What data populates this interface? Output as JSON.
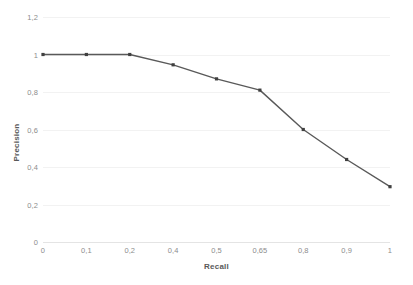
{
  "chart_data": {
    "type": "line",
    "title": "",
    "xlabel": "Recall",
    "ylabel": "Precision",
    "categories": [
      "0",
      "0,1",
      "0,2",
      "0,4",
      "0,5",
      "0,65",
      "0,8",
      "0,9",
      "1"
    ],
    "x_values": [
      0,
      0.1,
      0.2,
      0.4,
      0.5,
      0.65,
      0.8,
      0.9,
      1
    ],
    "series": [
      {
        "name": "Precision",
        "values": [
          1,
          1,
          1,
          0.945,
          0.87,
          0.81,
          0.6,
          0.44,
          0.295
        ]
      }
    ],
    "ylim": [
      0,
      1.2
    ],
    "y_ticks": [
      "0",
      "0,2",
      "0,4",
      "0,6",
      "0,8",
      "1",
      "1,2"
    ],
    "y_tick_values": [
      0,
      0.2,
      0.4,
      0.6,
      0.8,
      1,
      1.2
    ],
    "grid": true,
    "legend": "none",
    "line_color": "#595959",
    "marker_color": "#404040",
    "grid_color": "#f2f2f2",
    "label_color": "#8c8c8c",
    "title_color": "#595959",
    "background": "#ffffff"
  }
}
